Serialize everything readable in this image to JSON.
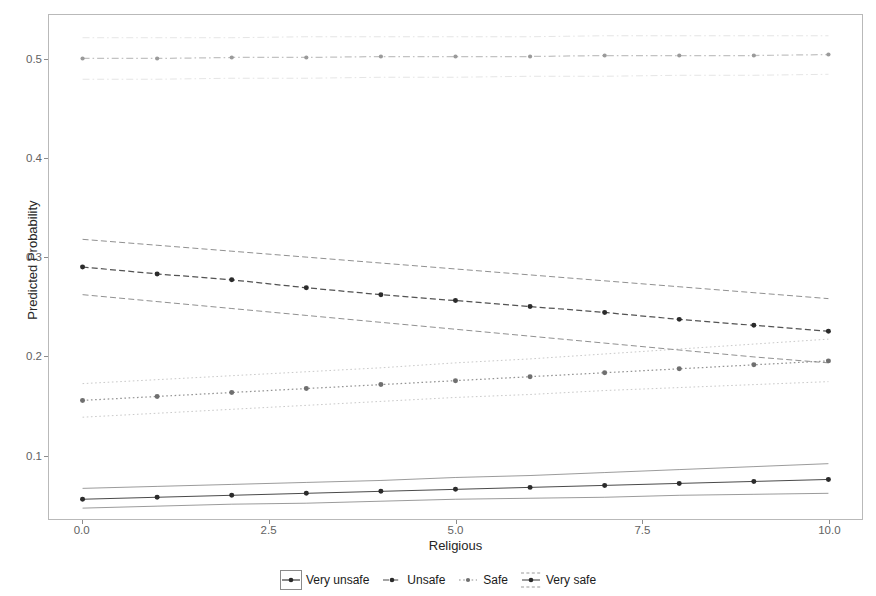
{
  "chart_data": {
    "type": "line",
    "title": "",
    "subtitle": "",
    "xlabel": "Religious",
    "ylabel": "Predicted Probability",
    "xlim": [
      -0.45,
      10.45
    ],
    "ylim": [
      0.035,
      0.545
    ],
    "xticks": [
      0.0,
      2.5,
      5.0,
      7.5,
      10.0
    ],
    "xtick_labels": [
      "0.0",
      "2.5",
      "5.0",
      "7.5",
      "10.0"
    ],
    "yticks": [
      0.1,
      0.2,
      0.3,
      0.4,
      0.5
    ],
    "ytick_labels": [
      "0.1",
      "0.2",
      "0.3",
      "0.4",
      "0.5"
    ],
    "grid": false,
    "legend_position": "bottom",
    "x": [
      0,
      1,
      2,
      3,
      4,
      5,
      6,
      7,
      8,
      9,
      10
    ],
    "series": [
      {
        "name": "Very unsafe",
        "linestyle": "solid",
        "color": "#3f3f3f",
        "marker": "circle",
        "values": [
          0.055,
          0.057,
          0.059,
          0.061,
          0.063,
          0.065,
          0.067,
          0.069,
          0.071,
          0.073,
          0.075
        ],
        "ci_upper": [
          0.066,
          0.068,
          0.07,
          0.072,
          0.074,
          0.077,
          0.079,
          0.082,
          0.085,
          0.088,
          0.091
        ],
        "ci_lower": [
          0.046,
          0.048,
          0.05,
          0.051,
          0.053,
          0.055,
          0.056,
          0.057,
          0.059,
          0.06,
          0.061
        ]
      },
      {
        "name": "Unsafe",
        "linestyle": "dashed",
        "color": "#4a4a4a",
        "marker": "circle",
        "values": [
          0.29,
          0.283,
          0.277,
          0.269,
          0.262,
          0.256,
          0.25,
          0.244,
          0.237,
          0.231,
          0.225
        ],
        "ci_upper": [
          0.318,
          0.312,
          0.306,
          0.3,
          0.294,
          0.288,
          0.282,
          0.276,
          0.27,
          0.264,
          0.258
        ],
        "ci_lower": [
          0.262,
          0.255,
          0.248,
          0.241,
          0.234,
          0.227,
          0.22,
          0.213,
          0.206,
          0.199,
          0.193
        ]
      },
      {
        "name": "Safe",
        "linestyle": "dotted",
        "color": "#8e8e8e",
        "marker": "circle",
        "values": [
          0.155,
          0.159,
          0.163,
          0.167,
          0.171,
          0.175,
          0.179,
          0.183,
          0.187,
          0.191,
          0.195
        ],
        "ci_upper": [
          0.172,
          0.176,
          0.18,
          0.184,
          0.188,
          0.193,
          0.197,
          0.202,
          0.207,
          0.212,
          0.217
        ],
        "ci_lower": [
          0.138,
          0.142,
          0.146,
          0.15,
          0.154,
          0.158,
          0.161,
          0.165,
          0.168,
          0.171,
          0.174
        ]
      },
      {
        "name": "Very safe",
        "linestyle": "dashdot",
        "color": "#a8a8a8",
        "marker": "circle",
        "values": [
          0.501,
          0.501,
          0.502,
          0.502,
          0.503,
          0.503,
          0.503,
          0.504,
          0.504,
          0.504,
          0.505
        ],
        "ci_upper": [
          0.522,
          0.522,
          0.522,
          0.523,
          0.523,
          0.523,
          0.523,
          0.524,
          0.524,
          0.524,
          0.524
        ],
        "ci_lower": [
          0.48,
          0.48,
          0.481,
          0.481,
          0.482,
          0.482,
          0.483,
          0.483,
          0.484,
          0.484,
          0.485
        ]
      }
    ]
  },
  "legend": {
    "entries": [
      {
        "label": "Very unsafe",
        "key": "line-key-solid"
      },
      {
        "label": "Unsafe",
        "key": "line-key-dashed"
      },
      {
        "label": "Safe",
        "key": "line-key-dotted"
      },
      {
        "label": "Very safe",
        "key": "line-key-dashdot"
      }
    ]
  },
  "axes": {
    "x_title": "Religious",
    "y_title": "Predicted Probability"
  }
}
